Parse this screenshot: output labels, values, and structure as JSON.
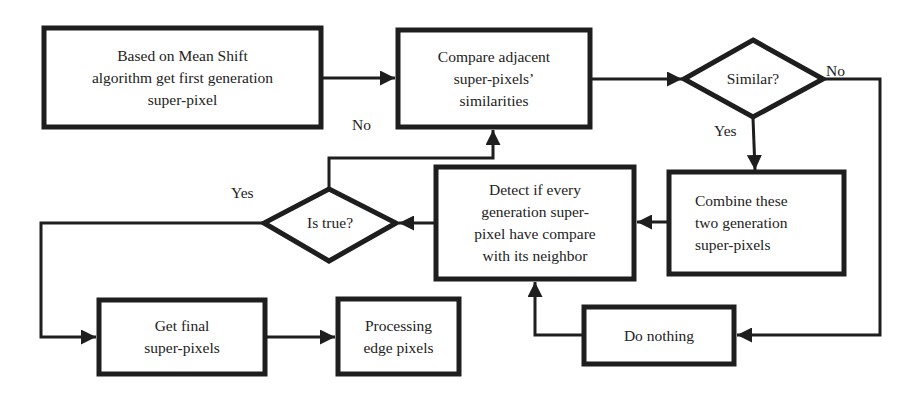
{
  "nodes": {
    "mean_shift": "Based on Mean Shift\nalgorithm get first generation\nsuper-pixel",
    "compare": "Compare adjacent\nsuper-pixels’\nsimilarities",
    "similar": "Similar?",
    "combine": "Combine these\ntwo generation\nsuper-pixels",
    "detect": "Detect if every\ngeneration super-\npixel have compare\nwith its neighbor",
    "is_true": "Is true?",
    "final": "Get final\nsuper-pixels",
    "processing": "Processing\nedge pixels",
    "do_nothing": "Do nothing"
  },
  "labels": {
    "similar_no": "No",
    "similar_yes": "Yes",
    "istrue_no": "No",
    "istrue_yes": "Yes"
  },
  "colors": {
    "stroke": "#1e1e1e",
    "background": "#ffffff"
  }
}
